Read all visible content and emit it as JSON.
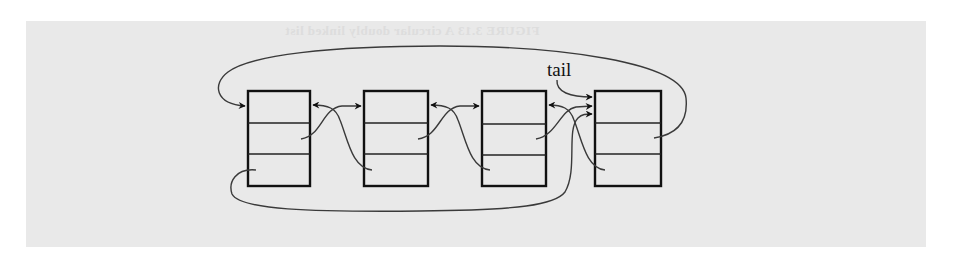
{
  "figure": {
    "ghost_caption": "FIGURE 3.13  A circular doubly linked list",
    "background_color": "#e9e9e9",
    "stroke_color": "#111111"
  },
  "diagram": {
    "type": "circular-doubly-linked-list",
    "label": "tail",
    "label_target": "node-4",
    "nodes": [
      {
        "id": "node-1",
        "fields": [
          "element",
          "next",
          "prev"
        ]
      },
      {
        "id": "node-2",
        "fields": [
          "element",
          "next",
          "prev"
        ]
      },
      {
        "id": "node-3",
        "fields": [
          "element",
          "next",
          "prev"
        ]
      },
      {
        "id": "node-4",
        "fields": [
          "element",
          "next",
          "prev"
        ]
      }
    ],
    "edges": [
      {
        "from": "node-1.next",
        "to": "node-2"
      },
      {
        "from": "node-2.next",
        "to": "node-3"
      },
      {
        "from": "node-3.next",
        "to": "node-4"
      },
      {
        "from": "node-4.next",
        "to": "node-1"
      },
      {
        "from": "node-2.prev",
        "to": "node-1"
      },
      {
        "from": "node-3.prev",
        "to": "node-2"
      },
      {
        "from": "node-4.prev",
        "to": "node-3"
      },
      {
        "from": "node-1.prev",
        "to": "node-4"
      },
      {
        "from": "tail",
        "to": "node-4"
      }
    ]
  }
}
